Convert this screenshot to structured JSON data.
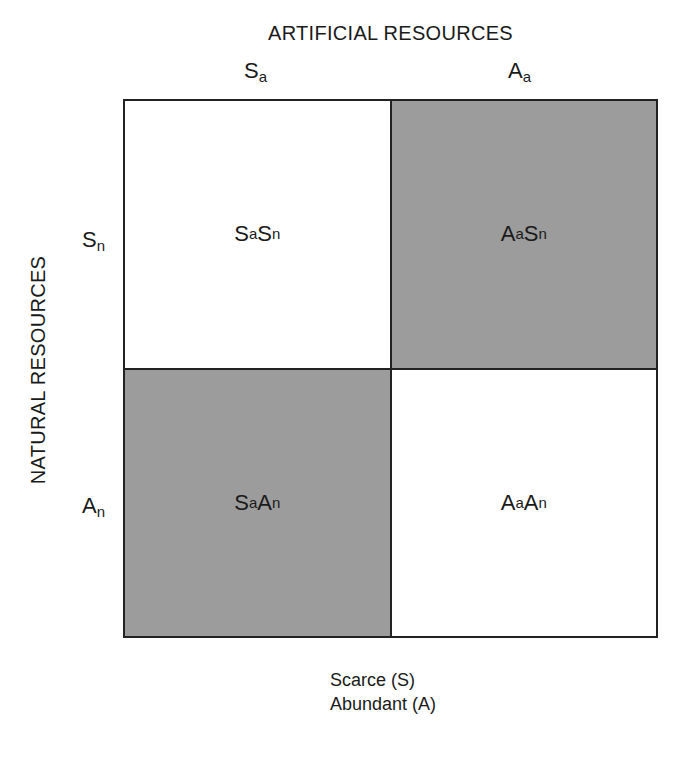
{
  "title_top": "ARTIFICIAL RESOURCES",
  "title_side": "NATURAL RESOURCES",
  "columns": [
    {
      "base": "S",
      "sub": "a"
    },
    {
      "base": "A",
      "sub": "a"
    }
  ],
  "rows": [
    {
      "base": "S",
      "sub": "n"
    },
    {
      "base": "A",
      "sub": "n"
    }
  ],
  "cells": {
    "top_left": {
      "b1": "S",
      "s1": "a",
      "b2": "S",
      "s2": "n",
      "shaded": false
    },
    "top_right": {
      "b1": "A",
      "s1": "a",
      "b2": "S",
      "s2": "n",
      "shaded": true
    },
    "bottom_left": {
      "b1": "S",
      "s1": "a",
      "b2": "A",
      "s2": "n",
      "shaded": true
    },
    "bottom_right": {
      "b1": "A",
      "s1": "a",
      "b2": "A",
      "s2": "n",
      "shaded": false
    }
  },
  "legend": [
    "Scarce (S)",
    "Abundant (A)"
  ],
  "colors": {
    "shade": "#9c9c9c",
    "line": "#222222"
  }
}
